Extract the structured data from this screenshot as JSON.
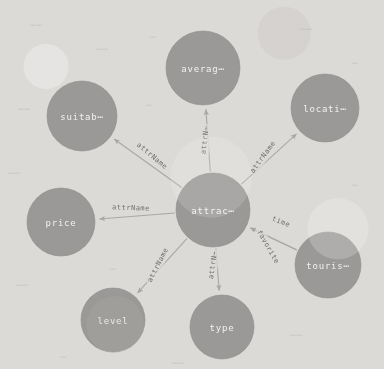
{
  "diagram": {
    "type": "node-link-graph",
    "background_color": "#dcdad6",
    "node_fill_color": "#9b9997",
    "node_text_color": "#f2f1ef",
    "edge_color": "#a9a7a4",
    "edge_label_color": "#6f6d6b"
  },
  "nodes": [
    {
      "id": "attraction",
      "label": "attrac⋯",
      "cx": 213,
      "cy": 210,
      "r": 37,
      "role": "center-entity"
    },
    {
      "id": "average",
      "label": "averag⋯",
      "cx": 203,
      "cy": 68,
      "r": 37,
      "role": "attribute"
    },
    {
      "id": "location",
      "label": "locati⋯",
      "cx": 325,
      "cy": 108,
      "r": 34,
      "role": "attribute"
    },
    {
      "id": "suitable",
      "label": "suitab⋯",
      "cx": 82,
      "cy": 116,
      "r": 35,
      "role": "attribute"
    },
    {
      "id": "price",
      "label": "price",
      "cx": 61,
      "cy": 222,
      "r": 34,
      "role": "attribute"
    },
    {
      "id": "level",
      "label": "level",
      "cx": 113,
      "cy": 320,
      "r": 32,
      "role": "attribute"
    },
    {
      "id": "type",
      "label": "type",
      "cx": 222,
      "cy": 327,
      "r": 32,
      "role": "attribute"
    },
    {
      "id": "tourist",
      "label": "touris⋯",
      "cx": 328,
      "cy": 265,
      "r": 33,
      "role": "related-entity"
    }
  ],
  "edges": [
    {
      "id": "e-average",
      "from": "attraction",
      "to": "average",
      "label": "attrN⋯",
      "label_x": 205,
      "label_y": 140,
      "label_rotate": -84
    },
    {
      "id": "e-location",
      "from": "attraction",
      "to": "location",
      "label": "attrName",
      "label_x": 263,
      "label_y": 157,
      "label_rotate": -54
    },
    {
      "id": "e-suitable",
      "from": "attraction",
      "to": "suitable",
      "label": "attrName",
      "label_x": 152,
      "label_y": 156,
      "label_rotate": 40
    },
    {
      "id": "e-price",
      "from": "attraction",
      "to": "price",
      "label": "attrName",
      "label_x": 131,
      "label_y": 208,
      "label_rotate": 2
    },
    {
      "id": "e-level",
      "from": "attraction",
      "to": "level",
      "label": "attrName",
      "label_x": 158,
      "label_y": 265,
      "label_rotate": -63
    },
    {
      "id": "e-type",
      "from": "attraction",
      "to": "type",
      "label": "attrN⋯",
      "label_x": 213,
      "label_y": 265,
      "label_rotate": -82
    },
    {
      "id": "e-time",
      "from": "tourist",
      "to": "attraction",
      "label": "time",
      "label_x": 281,
      "label_y": 222,
      "label_rotate": 22
    },
    {
      "id": "e-favorite",
      "from": "tourist",
      "to": "attraction",
      "label": "favorite",
      "label_x": 268,
      "label_y": 247,
      "label_rotate": 60
    }
  ],
  "ghost_marks": [
    {
      "text": "⋯⋯",
      "x": 30,
      "y": 20
    },
    {
      "text": "⋯⋯",
      "x": 96,
      "y": 44
    },
    {
      "text": "⋯",
      "x": 150,
      "y": 32
    },
    {
      "text": "⋯⋯",
      "x": 300,
      "y": 24
    },
    {
      "text": "⋯",
      "x": 352,
      "y": 58
    },
    {
      "text": "⋯⋯",
      "x": 18,
      "y": 104
    },
    {
      "text": "⋯",
      "x": 146,
      "y": 100
    },
    {
      "text": "⋯⋯",
      "x": 8,
      "y": 168
    },
    {
      "text": "⋯",
      "x": 352,
      "y": 180
    },
    {
      "text": "⋯⋯",
      "x": 16,
      "y": 280
    },
    {
      "text": "⋯",
      "x": 110,
      "y": 264
    },
    {
      "text": "⋯⋯",
      "x": 290,
      "y": 330
    },
    {
      "text": "⋯",
      "x": 60,
      "y": 352
    },
    {
      "text": "⋯⋯",
      "x": 172,
      "y": 358
    }
  ]
}
